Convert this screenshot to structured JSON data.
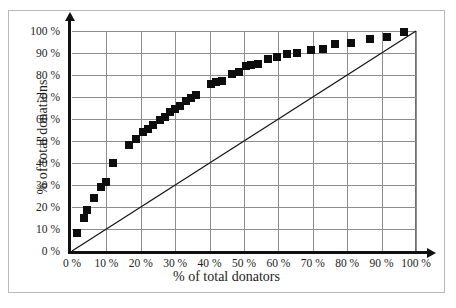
{
  "chart_data": {
    "type": "scatter",
    "title": "",
    "xlabel": "% of total donators",
    "ylabel": "% of total donations",
    "xlim": [
      0,
      100
    ],
    "ylim": [
      0,
      100
    ],
    "grid": true,
    "legend": "none",
    "x_ticks": [
      "0 %",
      "10 %",
      "20 %",
      "30 %",
      "40 %",
      "50 %",
      "60 %",
      "70 %",
      "80 %",
      "90 %",
      "100 %"
    ],
    "y_ticks": [
      "0 %",
      "10 %",
      "20 %",
      "30 %",
      "40 %",
      "50 %",
      "60 %",
      "70 %",
      "80 %",
      "90 %",
      "100 %"
    ],
    "x_tick_values": [
      0,
      10,
      20,
      30,
      40,
      50,
      60,
      70,
      80,
      90,
      100
    ],
    "y_tick_values": [
      0,
      10,
      20,
      30,
      40,
      50,
      60,
      70,
      80,
      90,
      100
    ],
    "series": [
      {
        "name": "donation concentration",
        "marker": "filled-square",
        "color": "#0d0d0d",
        "points": [
          [
            1.5,
            8
          ],
          [
            3.5,
            15
          ],
          [
            4.5,
            18.5
          ],
          [
            6.5,
            24
          ],
          [
            8.5,
            29
          ],
          [
            10,
            31.5
          ],
          [
            12,
            40
          ],
          [
            16.5,
            48
          ],
          [
            18.5,
            51
          ],
          [
            20.5,
            54
          ],
          [
            22,
            55.5
          ],
          [
            23.5,
            57.5
          ],
          [
            25.5,
            59.5
          ],
          [
            27,
            61
          ],
          [
            28.5,
            63
          ],
          [
            30,
            64.5
          ],
          [
            31.5,
            66
          ],
          [
            33,
            68
          ],
          [
            34.5,
            69.5
          ],
          [
            36,
            71
          ],
          [
            40.5,
            76
          ],
          [
            42,
            77
          ],
          [
            43.5,
            77.5
          ],
          [
            46.5,
            80.5
          ],
          [
            48.5,
            81.5
          ],
          [
            50.5,
            84
          ],
          [
            52,
            84.5
          ],
          [
            54,
            85
          ],
          [
            57,
            87.5
          ],
          [
            59.5,
            88
          ],
          [
            62.5,
            89.5
          ],
          [
            65.5,
            90
          ],
          [
            69.5,
            91.5
          ],
          [
            73,
            92
          ],
          [
            76.5,
            94
          ],
          [
            81,
            94.5
          ],
          [
            86.5,
            96.5
          ],
          [
            91.5,
            97.5
          ],
          [
            96.5,
            99.5
          ]
        ]
      },
      {
        "name": "line of equality",
        "type": "line",
        "color": "#111111",
        "points": [
          [
            0,
            0
          ],
          [
            100,
            100
          ]
        ]
      }
    ]
  },
  "axis": {
    "x_title": "% of total donators",
    "y_title": "% of total donations"
  },
  "caption": {
    "text": ""
  }
}
